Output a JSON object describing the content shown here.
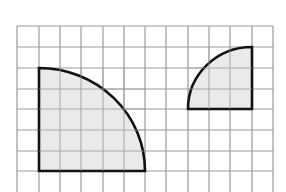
{
  "diagram": {
    "type": "grid-figures",
    "grid": {
      "columns": 12,
      "rows_visible": 8,
      "line_color": "#999999",
      "background": "#ffffff"
    },
    "shapes": [
      {
        "name": "large-quarter-circle",
        "kind": "quarter-circle",
        "radius_cells": 5,
        "fill": "#e6e6e6",
        "stroke": "#111111"
      },
      {
        "name": "small-quarter-circle",
        "kind": "quarter-circle",
        "radius_cells": 3,
        "fill": "#e6e6e6",
        "stroke": "#111111"
      }
    ]
  }
}
